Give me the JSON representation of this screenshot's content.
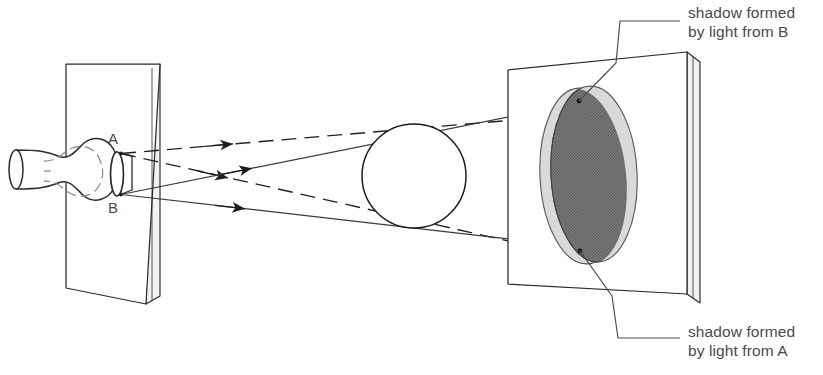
{
  "figure": {
    "kind": "optics-shadow-diagram",
    "clipped_heading": "occurred.",
    "point_labels": {
      "a": "A",
      "b": "B"
    },
    "callouts": [
      {
        "id": "shadow-from-b",
        "line1": "shadow formed",
        "line2": "by light from B"
      },
      {
        "id": "shadow-from-a",
        "line1": "shadow formed",
        "line2": "by light from A"
      }
    ],
    "colors": {
      "ink": "#222222",
      "line": "#3a3a3a",
      "text": "#4a4a4a",
      "umbra": "#6e6e6e",
      "penumbra": "#d9d9d9",
      "paper": "#ffffff",
      "plate_edge": "#e9e9e9"
    },
    "elements": {
      "lamp": "light-bulb",
      "aperture": "slit-aperture-with-points-A-and-B",
      "left_plate": "screen-with-aperture",
      "occluder": "sphere",
      "right_plate": "projection-screen",
      "rays_from_a": "dashed",
      "rays_from_b": "solid",
      "arrow_count": 4
    }
  }
}
